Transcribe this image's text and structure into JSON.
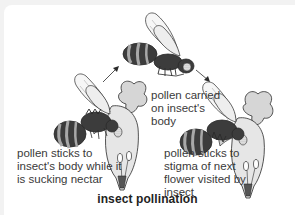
{
  "diagram": {
    "title": "insect pollination",
    "labels": {
      "pollen_carried": [
        "pollen carried",
        "on insect's",
        "body"
      ],
      "pollen_sticks_body": [
        "pollen sticks to",
        "insect's body while it",
        "is sucking nectar"
      ],
      "pollen_sticks_stigma": [
        "pollen sticks to",
        "stigma of next",
        "flower visited by",
        "insect"
      ]
    },
    "elements": {
      "bees": [
        "bee on first flower",
        "bee in flight carrying pollen",
        "bee on second flower"
      ],
      "flowers": [
        "first flower",
        "second flower"
      ],
      "arrows": [
        "first flower to flying bee",
        "flying bee to second flower"
      ]
    },
    "colors": {
      "dark_stripe": "#3c3c3c",
      "light_stripe": "#a8a8a8",
      "petal": "#d9d9d9",
      "outline": "#2a2a2a",
      "text": "#3a3a3a"
    }
  }
}
